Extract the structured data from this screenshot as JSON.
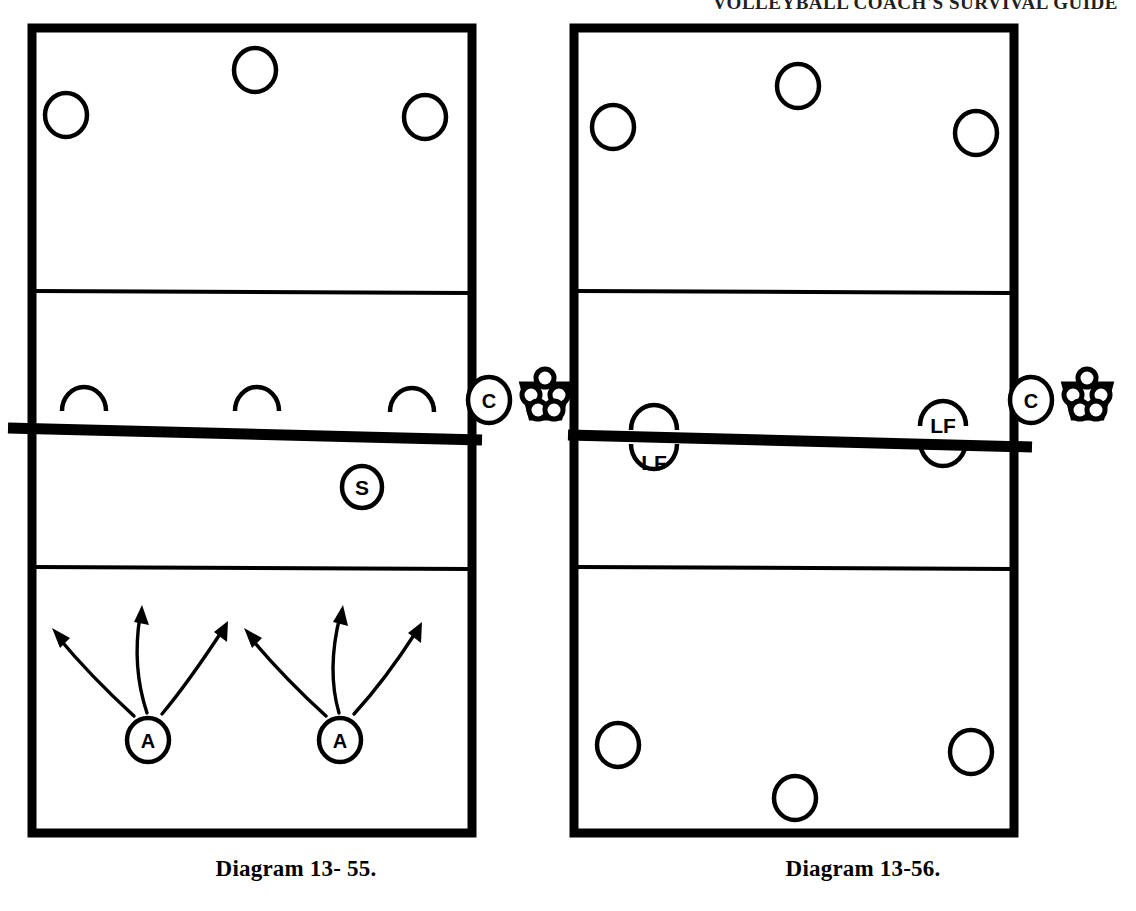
{
  "page": {
    "running_head": "VOLLEYBALL COACH'S SURVIVAL GUIDE",
    "background_color": "#ffffff",
    "ink_color": "#000000"
  },
  "figures": [
    {
      "id": "diagram-13-55",
      "caption": "Diagram 13- 55.",
      "court": {
        "type": "volleyball-court-halfview",
        "net_label": "net",
        "has_far_attack_line": true,
        "has_near_attack_line": true
      },
      "far_side_players": [
        {
          "symbol": "circle",
          "label": "",
          "name": "far-player-left"
        },
        {
          "symbol": "circle",
          "label": "",
          "name": "far-player-center"
        },
        {
          "symbol": "circle",
          "label": "",
          "name": "far-player-right"
        }
      ],
      "net_blockers": [
        {
          "symbol": "arc-up",
          "label": "",
          "name": "blocker-left"
        },
        {
          "symbol": "arc-up",
          "label": "",
          "name": "blocker-center"
        },
        {
          "symbol": "arc-up",
          "label": "",
          "name": "blocker-right"
        }
      ],
      "near_side_players": [
        {
          "symbol": "circle",
          "label": "S",
          "name": "setter"
        },
        {
          "symbol": "circle",
          "label": "A",
          "name": "attacker-left"
        },
        {
          "symbol": "circle",
          "label": "A",
          "name": "attacker-right"
        }
      ],
      "movement_arrows": [
        {
          "from": "attacker-left",
          "direction": "up-left",
          "name": "attack-arrow-left-1"
        },
        {
          "from": "attacker-left",
          "direction": "up",
          "name": "attack-arrow-left-2"
        },
        {
          "from": "attacker-left",
          "direction": "up-right",
          "name": "attack-arrow-left-3"
        },
        {
          "from": "attacker-right",
          "direction": "up-left",
          "name": "attack-arrow-right-1"
        },
        {
          "from": "attacker-right",
          "direction": "up",
          "name": "attack-arrow-right-2"
        },
        {
          "from": "attacker-right",
          "direction": "up-right",
          "name": "attack-arrow-right-3"
        }
      ],
      "sideline_items": [
        {
          "symbol": "circle",
          "label": "C",
          "name": "coach"
        },
        {
          "symbol": "ball-cart",
          "label": "",
          "ball_count": 5,
          "name": "ball-cart"
        }
      ]
    },
    {
      "id": "diagram-13-56",
      "caption": "Diagram 13-56.",
      "court": {
        "type": "volleyball-court-halfview",
        "net_label": "net",
        "has_far_attack_line": true,
        "has_near_attack_line": true
      },
      "far_side_players": [
        {
          "symbol": "circle",
          "label": "",
          "name": "far-player-left"
        },
        {
          "symbol": "circle",
          "label": "",
          "name": "far-player-center"
        },
        {
          "symbol": "circle",
          "label": "",
          "name": "far-player-right"
        }
      ],
      "net_blockers": [
        {
          "symbol": "split-arc",
          "label": "LF",
          "label_position": "below-net",
          "name": "left-front-near"
        },
        {
          "symbol": "split-arc",
          "label": "LF",
          "label_position": "above-net",
          "name": "left-front-far"
        }
      ],
      "near_side_players": [
        {
          "symbol": "circle",
          "label": "",
          "name": "near-player-left"
        },
        {
          "symbol": "circle",
          "label": "",
          "name": "near-player-center"
        },
        {
          "symbol": "circle",
          "label": "",
          "name": "near-player-right"
        }
      ],
      "movement_arrows": [],
      "sideline_items": [
        {
          "symbol": "circle",
          "label": "C",
          "name": "coach"
        },
        {
          "symbol": "ball-cart",
          "label": "",
          "ball_count": 5,
          "name": "ball-cart"
        }
      ]
    }
  ]
}
